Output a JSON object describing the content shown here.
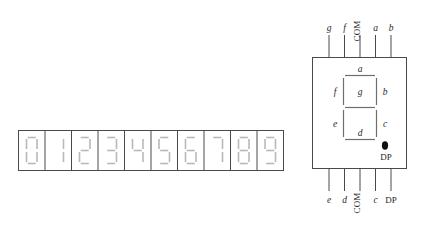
{
  "figure": {
    "background_color": "#ffffff",
    "line_color": "#4a4a4a",
    "text_color": "#1f1f1f",
    "segment_off_color": "#b9b9b9"
  },
  "digit_strip": {
    "name": "digit-strip",
    "cell_count": 10,
    "digits": [
      "0",
      "1",
      "2",
      "3",
      "4",
      "5",
      "6",
      "7",
      "8",
      "9"
    ],
    "lit_segments": {
      "0": [
        "a",
        "b",
        "c",
        "d",
        "e",
        "f"
      ],
      "1": [
        "b",
        "c"
      ],
      "2": [
        "a",
        "b",
        "g",
        "e",
        "d"
      ],
      "3": [
        "a",
        "b",
        "g",
        "c",
        "d"
      ],
      "4": [
        "f",
        "g",
        "b",
        "c"
      ],
      "5": [
        "a",
        "f",
        "g",
        "c",
        "d"
      ],
      "6": [
        "a",
        "f",
        "g",
        "e",
        "c",
        "d"
      ],
      "7": [
        "a",
        "b",
        "c"
      ],
      "8": [
        "a",
        "b",
        "c",
        "d",
        "e",
        "f",
        "g"
      ],
      "9": [
        "a",
        "b",
        "c",
        "d",
        "f",
        "g"
      ]
    }
  },
  "package": {
    "name": "seven-segment-package",
    "decimal_point_label": "DP",
    "internal_segment_labels": {
      "a": "a",
      "b": "b",
      "c": "c",
      "d": "d",
      "e": "e",
      "f": "f",
      "g": "g"
    },
    "top_pins": [
      {
        "label": "g",
        "rotated": false
      },
      {
        "label": "f",
        "rotated": false
      },
      {
        "label": "COM",
        "rotated": true
      },
      {
        "label": "a",
        "rotated": false
      },
      {
        "label": "b",
        "rotated": false
      }
    ],
    "bottom_pins": [
      {
        "label": "e",
        "rotated": false
      },
      {
        "label": "d",
        "rotated": false
      },
      {
        "label": "COM",
        "rotated": true
      },
      {
        "label": "c",
        "rotated": false
      },
      {
        "label": "DP",
        "rotated": false
      }
    ]
  }
}
